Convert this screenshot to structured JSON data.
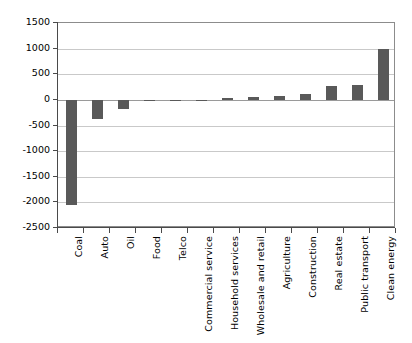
{
  "chart_data": {
    "type": "bar",
    "title": "",
    "subtitle": "",
    "xlabel": "",
    "ylabel": "",
    "grid": true,
    "legend": null,
    "orientation": "vertical",
    "bar_color": "#595959",
    "ylim": [
      -2500,
      1500
    ],
    "ytick_step": 500,
    "yticks": [
      1500,
      1000,
      500,
      0,
      -500,
      -1000,
      -1500,
      -2000,
      -2500
    ],
    "ytick_labels": [
      "1500",
      "1000",
      "500",
      "0",
      "-500",
      "-1000",
      "-1500",
      "-2000",
      "-2500"
    ],
    "categories": [
      "Coal",
      "Auto",
      "Oil",
      "Food",
      "Telco",
      "Commercial service",
      "Household services",
      "Wholesale and retail",
      "Agriculture",
      "Construction",
      "Real estate",
      "Public transport",
      "Clean energy"
    ],
    "values": [
      -2060,
      -380,
      -180,
      -10,
      -5,
      5,
      30,
      60,
      75,
      120,
      270,
      290,
      1000
    ]
  }
}
